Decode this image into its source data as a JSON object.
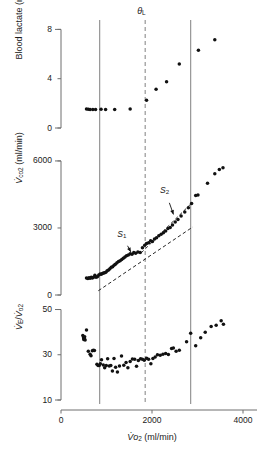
{
  "figure": {
    "type": "multi-panel-scatter",
    "xaxis": {
      "label": "V̇o2 (ml/min)",
      "label_main": "V̇o",
      "label_sub": "2",
      "label_unit": " (ml/min)",
      "min": 0,
      "max": 4000,
      "ticks": [
        0,
        2000,
        4000
      ],
      "ticklabels": [
        "0",
        "2000",
        "4000"
      ]
    },
    "markers": {
      "theta_l_label": "θ",
      "theta_l_sub": "L",
      "theta_l_value": 1850,
      "vline_left": 850,
      "vline_right": 2850,
      "vline_left_style": "solid",
      "vline_mid_style": "dashed",
      "vline_right_style": "solid",
      "line_color": "#8c8c8c"
    }
  },
  "chart_data": [
    {
      "id": "panel-lactate",
      "type": "scatter",
      "title": "",
      "xlabel": "",
      "ylabel": "Blood lactate (mmol/l)",
      "ylabel_parts": {
        "text": "Blood lactate (mmol/l)"
      },
      "xlim": [
        0,
        4000
      ],
      "ylim": [
        0,
        8.6
      ],
      "yticks": [
        0,
        4,
        8
      ],
      "yticklabels": [
        "0",
        "4",
        "8"
      ],
      "grid": false,
      "legend": "none",
      "series": [
        {
          "name": "blood lactate",
          "marker": "filled-circle",
          "color": "#111111",
          "points": [
            [
              560,
              1.55
            ],
            [
              600,
              1.52
            ],
            [
              640,
              1.5
            ],
            [
              700,
              1.5
            ],
            [
              760,
              1.5
            ],
            [
              880,
              1.52
            ],
            [
              980,
              1.5
            ],
            [
              1180,
              1.5
            ],
            [
              1520,
              1.55
            ],
            [
              1880,
              2.25
            ],
            [
              2090,
              3.15
            ],
            [
              2320,
              3.75
            ],
            [
              2600,
              5.2
            ],
            [
              3020,
              6.3
            ],
            [
              3380,
              7.15
            ]
          ]
        }
      ]
    },
    {
      "id": "panel-vco2",
      "type": "scatter",
      "title": "",
      "xlabel": "",
      "ylabel": "V̇co2 (ml/min)",
      "ylabel_parts": {
        "v": "V̇",
        "sub1": "co",
        "sub2": "2",
        "unit": " (ml/min)"
      },
      "xlim": [
        0,
        4000
      ],
      "ylim": [
        0,
        6400
      ],
      "yticks": [
        0,
        3000,
        6000
      ],
      "yticklabels": [
        "0",
        "3000",
        "6000"
      ],
      "grid": false,
      "legend": "none",
      "annotations": [
        {
          "text": "S",
          "sub": "1",
          "x": 1390,
          "y": 2480,
          "arrow_to_x": 1560,
          "arrow_to_y": 1830
        },
        {
          "text": "S",
          "sub": "2",
          "x": 2330,
          "y": 4420,
          "arrow_to_x": 2490,
          "arrow_to_y": 3500
        }
      ],
      "fit_lines": [
        {
          "name": "S1",
          "style": "dashed",
          "x1": 820,
          "y1": 190,
          "x2": 2900,
          "y2": 3050
        },
        {
          "name": "S2",
          "style": "dashed",
          "x1": 1760,
          "y1": 1880,
          "x2": 2860,
          "y2": 4090
        }
      ],
      "series": [
        {
          "name": "VCO2",
          "marker": "filled-circle",
          "color": "#111111",
          "points": [
            [
              560,
              760
            ],
            [
              590,
              740
            ],
            [
              615,
              770
            ],
            [
              640,
              755
            ],
            [
              665,
              790
            ],
            [
              690,
              760
            ],
            [
              715,
              800
            ],
            [
              745,
              880
            ],
            [
              770,
              800
            ],
            [
              800,
              820
            ],
            [
              830,
              900
            ],
            [
              860,
              940
            ],
            [
              885,
              930
            ],
            [
              910,
              960
            ],
            [
              935,
              990
            ],
            [
              960,
              1000
            ],
            [
              985,
              1020
            ],
            [
              1015,
              1080
            ],
            [
              1045,
              1120
            ],
            [
              1075,
              1180
            ],
            [
              1105,
              1240
            ],
            [
              1135,
              1260
            ],
            [
              1165,
              1330
            ],
            [
              1195,
              1380
            ],
            [
              1230,
              1440
            ],
            [
              1265,
              1500
            ],
            [
              1300,
              1530
            ],
            [
              1335,
              1590
            ],
            [
              1370,
              1640
            ],
            [
              1405,
              1700
            ],
            [
              1440,
              1760
            ],
            [
              1480,
              1790
            ],
            [
              1520,
              1850
            ],
            [
              1560,
              1820
            ],
            [
              1600,
              1900
            ],
            [
              1640,
              1870
            ],
            [
              1690,
              1930
            ],
            [
              1740,
              1900
            ],
            [
              1790,
              2120
            ],
            [
              1840,
              2230
            ],
            [
              1880,
              2300
            ],
            [
              1925,
              2340
            ],
            [
              1970,
              2430
            ],
            [
              2010,
              2400
            ],
            [
              2055,
              2510
            ],
            [
              2100,
              2560
            ],
            [
              2150,
              2650
            ],
            [
              2200,
              2720
            ],
            [
              2250,
              2790
            ],
            [
              2300,
              2860
            ],
            [
              2350,
              2980
            ],
            [
              2400,
              3020
            ],
            [
              2450,
              3130
            ],
            [
              2510,
              3270
            ],
            [
              2570,
              3380
            ],
            [
              2640,
              3540
            ],
            [
              2720,
              3720
            ],
            [
              2800,
              3900
            ],
            [
              2870,
              4090
            ],
            [
              2960,
              4450
            ],
            [
              3010,
              4470
            ],
            [
              3220,
              5000
            ],
            [
              3380,
              5430
            ],
            [
              3480,
              5620
            ],
            [
              3560,
              5700
            ]
          ]
        }
      ]
    },
    {
      "id": "panel-ve-vo2",
      "type": "scatter",
      "title": "",
      "xlabel": "",
      "ylabel": "V̇E/V̇o2",
      "ylabel_parts": {
        "v1": "V̇",
        "sub1": "E",
        "slash": "/",
        "v2": "V̇",
        "sub2": "o",
        "sub3": "2"
      },
      "xlim": [
        0,
        4000
      ],
      "ylim": [
        10,
        52
      ],
      "yticks": [
        10,
        30,
        50
      ],
      "yticklabels": [
        "10",
        "30",
        "50"
      ],
      "grid": false,
      "legend": "none",
      "series": [
        {
          "name": "ventilatory equivalent for O2",
          "marker": "filled-circle",
          "color": "#111111",
          "points": [
            [
              480,
              38.5
            ],
            [
              495,
              37.5
            ],
            [
              500,
              36.8
            ],
            [
              512,
              37.2
            ],
            [
              520,
              38.0
            ],
            [
              530,
              36.5
            ],
            [
              560,
              41.0
            ],
            [
              600,
              31.5
            ],
            [
              640,
              30.2
            ],
            [
              660,
              29.6
            ],
            [
              690,
              31.8
            ],
            [
              710,
              32.0
            ],
            [
              735,
              31.9
            ],
            [
              790,
              25.8
            ],
            [
              815,
              25.3
            ],
            [
              840,
              25.2
            ],
            [
              865,
              26.0
            ],
            [
              890,
              27.8
            ],
            [
              930,
              25.5
            ],
            [
              960,
              24.3
            ],
            [
              995,
              25.2
            ],
            [
              1025,
              28.2
            ],
            [
              1060,
              25.0
            ],
            [
              1095,
              25.3
            ],
            [
              1130,
              22.8
            ],
            [
              1165,
              28.4
            ],
            [
              1200,
              24.5
            ],
            [
              1240,
              22.4
            ],
            [
              1285,
              25.0
            ],
            [
              1330,
              29.5
            ],
            [
              1380,
              25.4
            ],
            [
              1430,
              26.6
            ],
            [
              1470,
              24.3
            ],
            [
              1520,
              27.0
            ],
            [
              1570,
              28.1
            ],
            [
              1620,
              28.0
            ],
            [
              1660,
              24.9
            ],
            [
              1700,
              27.5
            ],
            [
              1750,
              28.2
            ],
            [
              1790,
              28.0
            ],
            [
              1830,
              27.6
            ],
            [
              1880,
              28.5
            ],
            [
              1925,
              28.0
            ],
            [
              1975,
              26.0
            ],
            [
              2020,
              28.4
            ],
            [
              2070,
              29.0
            ],
            [
              2120,
              30.0
            ],
            [
              2180,
              29.8
            ],
            [
              2240,
              30.2
            ],
            [
              2300,
              30.6
            ],
            [
              2360,
              30.1
            ],
            [
              2430,
              32.8
            ],
            [
              2470,
              33.0
            ],
            [
              2530,
              31.6
            ],
            [
              2600,
              32.0
            ],
            [
              2760,
              35.8
            ],
            [
              2850,
              39.5
            ],
            [
              2960,
              34.0
            ],
            [
              3070,
              37.5
            ],
            [
              3170,
              40.0
            ],
            [
              3300,
              42.5
            ],
            [
              3410,
              43.0
            ],
            [
              3520,
              45.0
            ],
            [
              3570,
              43.5
            ]
          ]
        }
      ]
    }
  ]
}
